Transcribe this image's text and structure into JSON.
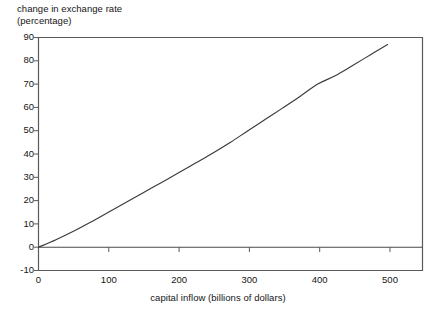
{
  "chart_data": {
    "type": "line",
    "title": "",
    "ylabel": "change in exchange rate\n(percentage)",
    "xlabel": "capital inflow (billions of dollars)",
    "xlim": [
      0,
      550
    ],
    "ylim": [
      -10,
      90
    ],
    "xticks": [
      0,
      100,
      200,
      300,
      400,
      500
    ],
    "xtick_labels": [
      "0",
      "100",
      "200",
      "300",
      "400",
      "500"
    ],
    "yticks": [
      -10,
      0,
      10,
      20,
      30,
      40,
      50,
      60,
      70,
      80,
      90
    ],
    "ytick_labels": [
      "-10",
      "0",
      "10",
      "20",
      "30",
      "40",
      "50",
      "60",
      "70",
      "80",
      "90"
    ],
    "grid": false,
    "legend": false,
    "zero_line": true,
    "line_color": "#3a3a3a",
    "axis_color": "#555555",
    "series": [
      {
        "name": "change in exchange rate",
        "x": [
          0,
          25,
          50,
          75,
          100,
          125,
          150,
          175,
          200,
          225,
          250,
          275,
          300,
          325,
          350,
          375,
          400,
          425,
          450,
          475,
          500
        ],
        "values": [
          0,
          3.2,
          6.8,
          10.8,
          15.0,
          19.2,
          23.4,
          27.6,
          31.8,
          36.1,
          40.4,
          45.0,
          50.0,
          54.9,
          59.8,
          64.8,
          70.0,
          73.6,
          78.0,
          82.5,
          87.0
        ]
      }
    ]
  },
  "labels": {
    "y_axis_title": "change in exchange rate\n(percentage)",
    "x_axis_title": "capital inflow (billions of dollars)"
  }
}
